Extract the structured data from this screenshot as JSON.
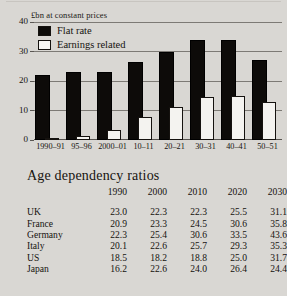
{
  "chart_data": {
    "type": "bar",
    "title": "",
    "ylabel": "£bn at constant prices",
    "xlabel": "",
    "ylim": [
      0,
      40
    ],
    "yticks": [
      0,
      10,
      20,
      30,
      40
    ],
    "grid": true,
    "legend_position": "top-left",
    "categories": [
      "1990–91",
      "95–96",
      "2000–01",
      "10–11",
      "20–21",
      "30–31",
      "40–41",
      "50–51"
    ],
    "series": [
      {
        "name": "Flat rate",
        "color": "#0d0b09",
        "values": [
          22.0,
          23.0,
          23.2,
          26.3,
          30.0,
          34.0,
          33.8,
          27.0
        ]
      },
      {
        "name": "Earnings related",
        "color": "#f4f3f0",
        "values": [
          0.6,
          1.2,
          3.5,
          7.8,
          11.2,
          14.7,
          14.8,
          13.0
        ]
      }
    ]
  },
  "chart": {
    "ylabel": "£bn at constant prices",
    "yticks": [
      "40",
      "30",
      "20",
      "10",
      "0"
    ],
    "legend": [
      {
        "label": "Flat rate",
        "swatch": "filled"
      },
      {
        "label": "Earnings related",
        "swatch": "open"
      }
    ],
    "xlabels": [
      "1990–91",
      "95–96",
      "2000–01",
      "10–11",
      "20–21",
      "30–31",
      "40–41",
      "50–51"
    ]
  },
  "table": {
    "title": "Age dependency ratios",
    "columns": [
      "",
      "1990",
      "2000",
      "2010",
      "2020",
      "2030"
    ],
    "rows": [
      {
        "country": "UK",
        "values": [
          "23.0",
          "22.3",
          "22.3",
          "25.5",
          "31.1"
        ]
      },
      {
        "country": "France",
        "values": [
          "20.9",
          "23.3",
          "24.5",
          "30.6",
          "35.8"
        ]
      },
      {
        "country": "Germany",
        "values": [
          "22.3",
          "25.4",
          "30.6",
          "33.5",
          "43.6"
        ]
      },
      {
        "country": "Italy",
        "values": [
          "20.1",
          "22.6",
          "25.7",
          "29.3",
          "35.3"
        ]
      },
      {
        "country": "US",
        "values": [
          "18.5",
          "18.2",
          "18.8",
          "25.0",
          "31.7"
        ]
      },
      {
        "country": "Japan",
        "values": [
          "16.2",
          "22.6",
          "24.0",
          "26.4",
          "24.4"
        ]
      }
    ]
  }
}
